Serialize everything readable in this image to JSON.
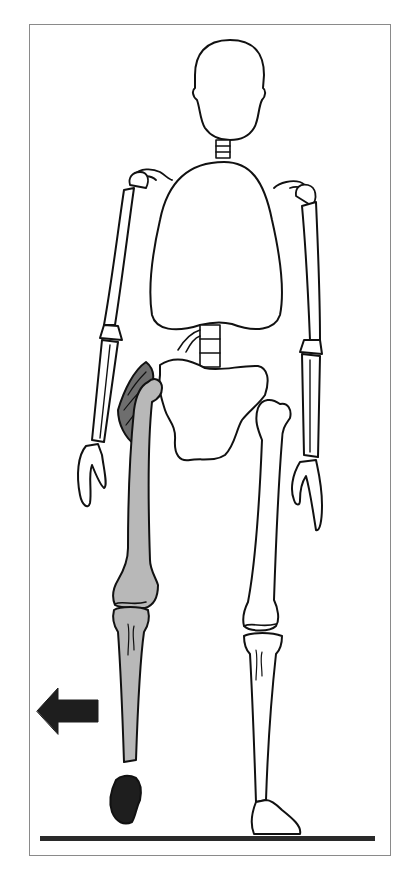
{
  "figure": {
    "subject": "Skeleton in frontal view, swinging right leg forward",
    "highlighted_limb": "leg (shaded grey)",
    "highlighted_muscle": "hip muscle (dark grey)",
    "arrow_direction": "left",
    "ground_line": true
  },
  "colors": {
    "outline": "#111111",
    "bone_fill": "#ffffff",
    "highlight_leg": "#b8b8b8",
    "muscle": "#6e6e6e",
    "foot_dark": "#1e1e1e",
    "arrow": "#1e1e1e",
    "frame": "#8a8a8a",
    "ground": "#2a2a2a"
  }
}
